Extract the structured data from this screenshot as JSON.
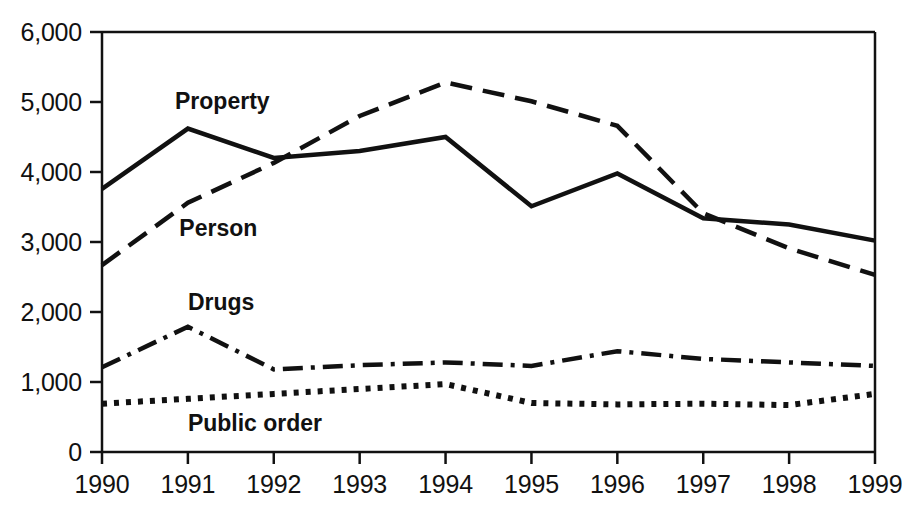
{
  "chart_data": {
    "type": "line",
    "title": "",
    "subtitle": "",
    "xlabel": "",
    "ylabel": "",
    "x": [
      1990,
      1991,
      1992,
      1993,
      1994,
      1995,
      1996,
      1997,
      1998,
      1999
    ],
    "categories": [
      "1990",
      "1991",
      "1992",
      "1993",
      "1994",
      "1995",
      "1996",
      "1997",
      "1998",
      "1999"
    ],
    "xlim": [
      1990,
      1999
    ],
    "ylim": [
      0,
      6000
    ],
    "y_ticks": [
      0,
      1000,
      2000,
      3000,
      4000,
      5000,
      6000
    ],
    "y_tick_labels": [
      "0",
      "1,000",
      "2,000",
      "3,000",
      "4,000",
      "5,000",
      "6,000"
    ],
    "grid": false,
    "legend_position": "inline-annotations",
    "series": [
      {
        "name": "Property",
        "label": "Property",
        "style": "solid",
        "color": "#111111",
        "values": [
          3760,
          4620,
          4200,
          4300,
          4500,
          3510,
          3980,
          3340,
          3250,
          3020
        ],
        "label_x": 1990.85,
        "label_y": 5000
      },
      {
        "name": "Person",
        "label": "Person",
        "style": "dashed",
        "color": "#111111",
        "values": [
          2670,
          3560,
          4130,
          4800,
          5280,
          5010,
          4660,
          3410,
          2910,
          2530
        ],
        "label_x": 1990.9,
        "label_y": 3180
      },
      {
        "name": "Drugs",
        "label": "Drugs",
        "style": "dash-dot",
        "color": "#111111",
        "values": [
          1210,
          1790,
          1180,
          1240,
          1280,
          1230,
          1440,
          1330,
          1280,
          1230
        ],
        "label_x": 1991.0,
        "label_y": 2130
      },
      {
        "name": "Public order",
        "label": "Public order",
        "style": "dotted",
        "color": "#111111",
        "values": [
          690,
          760,
          830,
          900,
          970,
          700,
          680,
          690,
          670,
          830
        ],
        "label_x": 1991.0,
        "label_y": 400
      }
    ]
  },
  "axis": {
    "axis_color": "#111111",
    "background": "#ffffff"
  }
}
